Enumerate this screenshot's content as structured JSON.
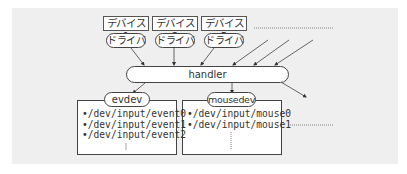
{
  "devices": [
    {
      "label": "デバイス1",
      "driver": "ドライバ"
    },
    {
      "label": "デバイス2",
      "driver": "ドライバ"
    },
    {
      "label": "デバイス3",
      "driver": "ドライバ"
    }
  ],
  "handler": {
    "label": "handler"
  },
  "nodes": [
    {
      "label": "evdev",
      "paths": [
        "•/dev/input/event0",
        "•/dev/input/event1",
        "•/dev/input/event2"
      ],
      "more": "⋮"
    },
    {
      "label": "mousedev",
      "paths": [
        "•/dev/input/mouse0",
        "•/dev/input/mouse1"
      ],
      "more": "⋮"
    }
  ],
  "colors": {
    "panel": "#efefef",
    "stroke": "#444444",
    "text": "#333333"
  }
}
